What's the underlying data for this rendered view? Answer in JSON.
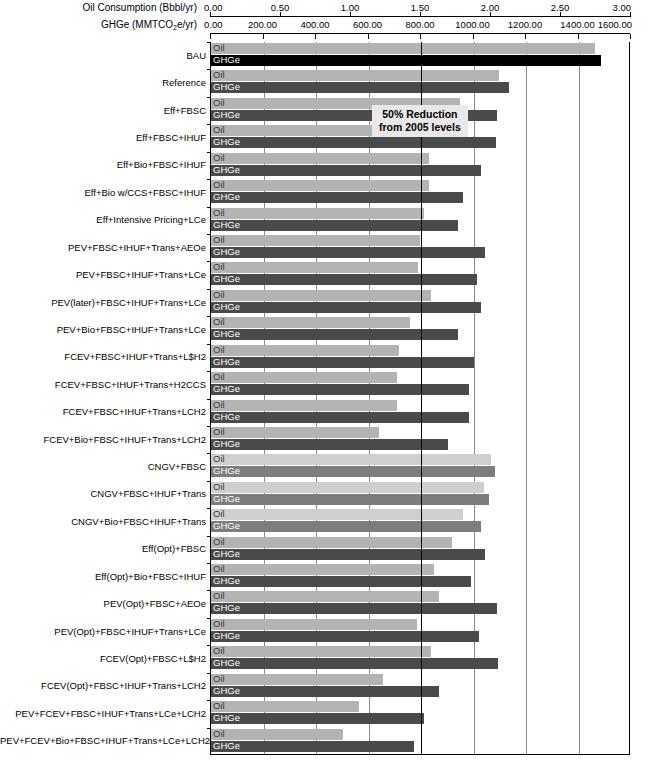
{
  "axes": {
    "oil": {
      "title": "Oil Consumption (Bbbl/yr)",
      "unit": "Bbbl/yr",
      "min": 0.0,
      "max": 3.0,
      "ticks": [
        "0.00",
        "0.50",
        "1.00",
        "1.50",
        "2.00",
        "2.50",
        "3.00"
      ],
      "tick_values": [
        0.0,
        0.5,
        1.0,
        1.5,
        2.0,
        2.5,
        3.0
      ]
    },
    "ghge": {
      "title_prefix": "GHGe (MMTCO",
      "title_sub": "2",
      "title_suffix": "e/yr)",
      "title_plain": "GHGe (MMTCO2e/yr)",
      "unit": "MMTCO2e/yr",
      "min": 0.0,
      "max": 1600.0,
      "ticks": [
        "0.00",
        "200.00",
        "400.00",
        "600.00",
        "800.00",
        "1000.00",
        "1200.00",
        "1400.00",
        "1600.00"
      ],
      "tick_values": [
        0,
        200,
        400,
        600,
        800,
        1000,
        1200,
        1400,
        1600
      ]
    }
  },
  "series_labels": {
    "oil": "Oil",
    "ghge": "GHGe"
  },
  "annotation": {
    "line1": "50% Reduction",
    "line2": "from 2005 levels",
    "target_ghge": 800
  },
  "colors": {
    "oil_default": "#b3b3b3",
    "ghge_default": "#4a4a4a",
    "ghge_bau": "#000000",
    "oil_light": "#cfcfcf",
    "ghge_light": "#7d7d7d",
    "gridline": "#8a8a8a",
    "axis": "#000000",
    "annotation_bg": "#e8e8e8"
  },
  "footnote": "",
  "chart_data": {
    "type": "bar",
    "orientation": "horizontal",
    "title": "",
    "xlabel": "Oil Consumption (Bbbl/yr)  /  GHGe (MMTCO2e/yr)",
    "ylabel": "",
    "grid": true,
    "legend_position": "in-bar",
    "xlim_oil": [
      0.0,
      3.0
    ],
    "xlim_ghge": [
      0,
      1600
    ],
    "categories": [
      "BAU",
      "Reference",
      "Eff+FBSC",
      "Eff+FBSC+IHUF",
      "Eff+Bio+FBSC+IHUF",
      "Eff+Bio w/CCS+FBSC+IHUF",
      "Eff+Intensive Pricing+LCe",
      "PEV+FBSC+IHUF+Trans+AEOe",
      "PEV+FBSC+IHUF+Trans+LCe",
      "PEV(later)+FBSC+IHUF+Trans+LCe",
      "PEV+Bio+FBSC+IHUF+Trans+LCe",
      "FCEV+FBSC+IHUF+Trans+L$H2",
      "FCEV+FBSC+IHUF+Trans+H2CCS",
      "FCEV+FBSC+IHUF+Trans+LCH2",
      "FCEV+Bio+FBSC+IHUF+Trans+LCH2",
      "CNGV+FBSC",
      "CNGV+FBSC+IHUF+Trans",
      "CNGV+Bio+FBSC+IHUF+Trans",
      "Eff(Opt)+FBSC",
      "Eff(Opt)+Bio+FBSC+IHUF",
      "PEV(Opt)+FBSC+AEOe",
      "PEV(Opt)+FBSC+IHUF+Trans+LCe",
      "FCEV(Opt)+FBSC+L$H2",
      "FCEV(Opt)+FBSC+IHUF+Trans+LCH2",
      "PEV+FCEV+FBSC+IHUF+Trans+LCe+LCH2",
      "PEV+FCEV+Bio+FBSC+IHUF+Trans+LCe+LCH2"
    ],
    "series": [
      {
        "name": "Oil",
        "unit": "Bbbl/yr",
        "values": [
          2.74,
          2.06,
          1.78,
          1.73,
          1.56,
          1.56,
          1.52,
          1.49,
          1.48,
          1.57,
          1.42,
          1.34,
          1.33,
          1.33,
          1.2,
          2.0,
          1.95,
          1.8,
          1.72,
          1.59,
          1.63,
          1.47,
          1.57,
          1.23,
          1.06,
          0.94
        ]
      },
      {
        "name": "GHGe",
        "unit": "MMTCO2e/yr",
        "values": [
          1486,
          1137,
          1090,
          1086,
          1028,
          960,
          941,
          1042,
          1012,
          1030,
          941,
          1000,
          983,
          983,
          902,
          1080,
          1060,
          1029,
          1042,
          990,
          1090,
          1020,
          1095,
          870,
          810,
          775
        ]
      }
    ],
    "row_styles": [
      "bau",
      "default",
      "default",
      "default",
      "default",
      "default",
      "default",
      "default",
      "default",
      "default",
      "default",
      "default",
      "default",
      "default",
      "default",
      "light",
      "light",
      "light",
      "default",
      "default",
      "default",
      "default",
      "default",
      "default",
      "default",
      "default"
    ]
  }
}
